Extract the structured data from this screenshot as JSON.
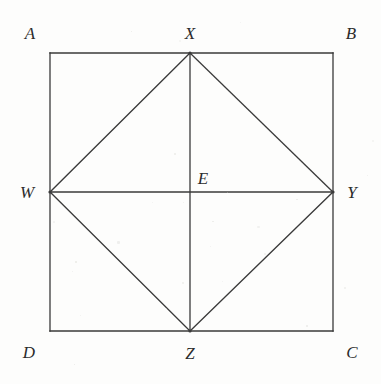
{
  "figure": {
    "width": 381,
    "height": 384,
    "background_color": "#fdfdfc",
    "stroke_color": "#3a3a3a",
    "stroke_width": 1.3,
    "label_color": "#2b2b2b"
  },
  "geometry": {
    "outer_square": {
      "name": "ABCD",
      "corners": [
        {
          "label": "A",
          "x": 50,
          "y": 53,
          "position": "top-left"
        },
        {
          "label": "B",
          "x": 333,
          "y": 53,
          "position": "top-right"
        },
        {
          "label": "C",
          "x": 333,
          "y": 331,
          "position": "bottom-right"
        },
        {
          "label": "D",
          "x": 50,
          "y": 331,
          "position": "bottom-left"
        }
      ],
      "side_length_px": 283
    },
    "inner_square": {
      "name": "WXYZ",
      "vertices": [
        {
          "label": "W",
          "x": 50,
          "y": 192,
          "on_side": "AD",
          "position": "left-midpoint"
        },
        {
          "label": "X",
          "x": 190,
          "y": 53,
          "on_side": "AB",
          "position": "top-midpoint"
        },
        {
          "label": "Y",
          "x": 333,
          "y": 192,
          "on_side": "BC",
          "position": "right-midpoint"
        },
        {
          "label": "Z",
          "x": 190,
          "y": 331,
          "on_side": "DC",
          "position": "bottom-midpoint"
        }
      ]
    },
    "center": {
      "label": "E",
      "x": 190,
      "y": 192
    },
    "diagonals": [
      {
        "name": "XZ",
        "from": "X",
        "to": "Z",
        "orientation": "vertical"
      },
      {
        "name": "WY",
        "from": "W",
        "to": "Y",
        "orientation": "horizontal"
      }
    ],
    "segments": [
      {
        "name": "WX",
        "from": "W",
        "to": "X"
      },
      {
        "name": "XY",
        "from": "X",
        "to": "Y"
      },
      {
        "name": "YZ",
        "from": "Y",
        "to": "Z"
      },
      {
        "name": "ZW",
        "from": "Z",
        "to": "W"
      }
    ]
  },
  "labels": [
    {
      "id": "A",
      "text": "A",
      "x": 30,
      "y": 33
    },
    {
      "id": "B",
      "text": "B",
      "x": 351,
      "y": 33
    },
    {
      "id": "X",
      "text": "X",
      "x": 190,
      "y": 33
    },
    {
      "id": "W",
      "text": "W",
      "x": 27,
      "y": 192
    },
    {
      "id": "Y",
      "text": "Y",
      "x": 352,
      "y": 192
    },
    {
      "id": "E",
      "text": "E",
      "x": 203,
      "y": 178
    },
    {
      "id": "D",
      "text": "D",
      "x": 29,
      "y": 352
    },
    {
      "id": "Z",
      "text": "Z",
      "x": 190,
      "y": 353
    },
    {
      "id": "C",
      "text": "C",
      "x": 352,
      "y": 352
    }
  ]
}
